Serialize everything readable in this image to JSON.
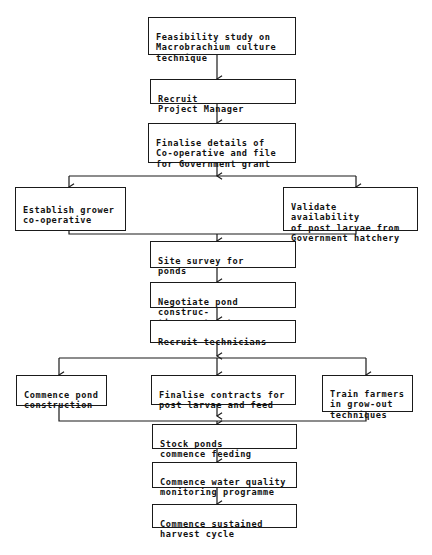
{
  "diagram": {
    "type": "flowchart",
    "direction": "top-to-bottom",
    "colors": {
      "line": "#1a1a1a",
      "text": "#111111",
      "background": "#ffffff"
    },
    "nodes": [
      {
        "id": "n1",
        "label": "Feasibility study on\nMacrobrachium culture\ntechnique"
      },
      {
        "id": "n2",
        "label": "Recruit\nProject Manager"
      },
      {
        "id": "n3",
        "label": "Finalise details of\nCo-operative and file\nfor Government grant"
      },
      {
        "id": "n4",
        "label": "Establish grower\nco-operative"
      },
      {
        "id": "n5",
        "label": "Validate availability\nof post larvae from\nGovernment hatchery"
      },
      {
        "id": "n6",
        "label": "Site survey for\nponds"
      },
      {
        "id": "n7",
        "label": "Negotiate pond construc-\ntion contract"
      },
      {
        "id": "n8",
        "label": "Recruit technicians"
      },
      {
        "id": "n9",
        "label": "Commence pond\nconstruction"
      },
      {
        "id": "n10",
        "label": "Finalise contracts for\npost larvae and feed"
      },
      {
        "id": "n11",
        "label": "Train farmers\nin grow-out\ntechniques"
      },
      {
        "id": "n12",
        "label": "Stock ponds\ncommence feeding"
      },
      {
        "id": "n13",
        "label": "Commence water quality\nmonitoring programme"
      },
      {
        "id": "n14",
        "label": "Commence sustained\nharvest cycle"
      }
    ],
    "edges": [
      [
        "n1",
        "n2"
      ],
      [
        "n2",
        "n3"
      ],
      [
        "n3",
        "n4"
      ],
      [
        "n3",
        "n5"
      ],
      [
        "n4",
        "n6"
      ],
      [
        "n5",
        "n6"
      ],
      [
        "n6",
        "n7"
      ],
      [
        "n7",
        "n8"
      ],
      [
        "n8",
        "n9"
      ],
      [
        "n8",
        "n10"
      ],
      [
        "n8",
        "n11"
      ],
      [
        "n9",
        "n12"
      ],
      [
        "n10",
        "n12"
      ],
      [
        "n11",
        "n12"
      ],
      [
        "n12",
        "n13"
      ],
      [
        "n13",
        "n14"
      ]
    ]
  }
}
